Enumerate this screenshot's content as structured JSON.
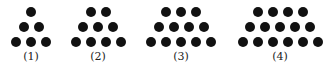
{
  "figures": [
    {
      "label": "(1)",
      "rows": [
        1,
        2,
        3
      ],
      "center_x": 31
    },
    {
      "label": "(2)",
      "rows": [
        2,
        3,
        4
      ],
      "center_x": 98
    },
    {
      "label": "(3)",
      "rows": [
        3,
        4,
        5
      ],
      "center_x": 181
    },
    {
      "label": "(4)",
      "rows": [
        4,
        5,
        6
      ],
      "center_x": 280
    }
  ],
  "style": {
    "dot_color": "#111111",
    "dot_spacing": 15,
    "row_y": [
      12,
      27,
      42
    ]
  }
}
